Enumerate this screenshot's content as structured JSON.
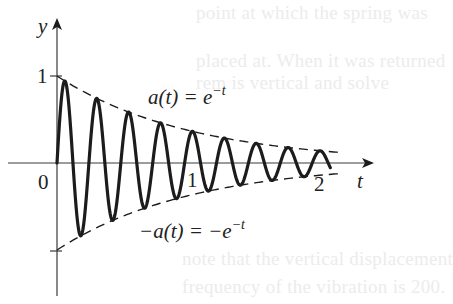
{
  "chart_data": {
    "type": "line",
    "title": "",
    "xlabel": "t",
    "ylabel": "y",
    "xlim": [
      0,
      2.3
    ],
    "ylim": [
      -1.3,
      1.6
    ],
    "grid": false,
    "legend": "none",
    "x_ticks": [
      {
        "value": 0,
        "label": "0"
      },
      {
        "value": 1,
        "label": "1"
      },
      {
        "value": 2,
        "label": "2"
      }
    ],
    "y_ticks": [
      {
        "value": 1,
        "label": "1"
      },
      {
        "value": -1,
        "label": ""
      }
    ],
    "series": [
      {
        "name": "damped oscillation",
        "style": "solid-thick",
        "formula": "y = e^{-t} sin(2π·4.2·t)",
        "t_range": [
          0,
          2.04
        ],
        "frequency_cycles_per_unit": 4.2,
        "sample_peaks_t": [
          0.06,
          0.3,
          0.54,
          0.77
        ],
        "sample_troughs_t": [
          0.18,
          0.42,
          0.66,
          0.9
        ]
      },
      {
        "name": "a(t)",
        "style": "dashed",
        "formula": "y = e^{-t}",
        "t_range": [
          0,
          2.1
        ]
      },
      {
        "name": "-a(t)",
        "style": "dashed",
        "formula": "y = -e^{-t}",
        "t_range": [
          0,
          2.1
        ]
      }
    ],
    "annotations": [
      {
        "text_main": "a(t) = e",
        "superscript": "−t",
        "t": 0.7,
        "y": 0.68
      },
      {
        "text_main": "−a(t) = −e",
        "superscript": "−t",
        "t": 0.63,
        "y": -0.8
      }
    ]
  },
  "axes": {
    "x_axis_label": "t",
    "y_axis_label": "y",
    "origin_label": "0",
    "tick_1_x": "1",
    "tick_2_x": "2",
    "tick_1_y": "1"
  },
  "annotations": {
    "upper_main": "a(t) = e",
    "upper_sup": "−t",
    "lower_main": "−a(t) = −e",
    "lower_sup": "−t"
  },
  "background_bleed": {
    "line1": "point at which the spring was",
    "line2": "placed at. When it was returned",
    "line3": "rem is vertical and solve",
    "line4": "note that the vertical displacement",
    "line5": "frequency of the vibration is 200."
  },
  "colors": {
    "ink": "#1c1c1c",
    "axis": "#3a3a3a",
    "background": "#ffffff",
    "bleed_text": "#ececec"
  }
}
